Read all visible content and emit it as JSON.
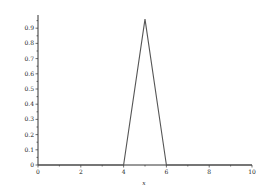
{
  "chart_data": {
    "type": "line",
    "title": "",
    "xlabel": "x",
    "ylabel": "",
    "xlim": [
      0,
      10
    ],
    "ylim": [
      0,
      0.97
    ],
    "grid": false,
    "legend": null,
    "x_ticks": [
      "0",
      "2",
      "4",
      "6",
      "8",
      "10"
    ],
    "y_ticks": [
      "0",
      "0.1",
      "0.2",
      "0.3",
      "0.4",
      "0.5",
      "0.6",
      "0.7",
      "0.8",
      "0.9"
    ],
    "series": [
      {
        "name": "triangular",
        "x": [
          0,
          4,
          5,
          6,
          10
        ],
        "y": [
          0,
          0,
          0.96,
          0,
          0
        ]
      }
    ],
    "line_color": "#555555"
  }
}
